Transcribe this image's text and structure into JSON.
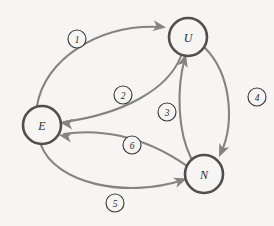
{
  "diagram": {
    "type": "directed-graph",
    "background_color": "#f7f5f3",
    "node_stroke_color": "#4f4f4f",
    "edge_color": "#838383",
    "badge_stroke_color": "#3d3d3d",
    "nodes": [
      {
        "id": "E",
        "label": "E",
        "cx": 42,
        "cy": 125,
        "r": 19
      },
      {
        "id": "U",
        "label": "U",
        "cx": 188,
        "cy": 37,
        "r": 19
      },
      {
        "id": "N",
        "label": "N",
        "cx": 204,
        "cy": 174,
        "r": 19
      }
    ],
    "edges": [
      {
        "id": "edge-1",
        "label": "1",
        "from": "E",
        "to": "U",
        "path": "M 37 106 C 44 60 98 24 160 27",
        "arrow": {
          "x": 166,
          "y": 27.5,
          "angle": 8
        },
        "badge": {
          "cx": 77,
          "cy": 39,
          "r": 9
        }
      },
      {
        "id": "edge-2",
        "label": "2",
        "from": "U",
        "to": "E",
        "path": "M 181 56 C 168 90 122 114 64 122",
        "arrow": {
          "x": 60,
          "y": 122.5,
          "angle": 187
        },
        "badge": {
          "cx": 123,
          "cy": 95,
          "r": 9
        }
      },
      {
        "id": "edge-3",
        "label": "3",
        "from": "N",
        "to": "U",
        "path": "M 191 158 C 178 132 176 90 185 58",
        "arrow": {
          "x": 186,
          "y": 54,
          "angle": -74
        },
        "badge": {
          "cx": 167,
          "cy": 112,
          "r": 9
        }
      },
      {
        "id": "edge-4",
        "label": "4",
        "from": "U",
        "to": "N",
        "path": "M 205 48 C 231 74 235 122 221 153",
        "arrow": {
          "x": 219,
          "y": 157,
          "angle": 114
        },
        "badge": {
          "cx": 257,
          "cy": 97,
          "r": 9
        }
      },
      {
        "id": "edge-5",
        "label": "5",
        "from": "E",
        "to": "N",
        "path": "M 41 145 C 55 183 125 199 183 180",
        "arrow": {
          "x": 187,
          "y": 178.5,
          "angle": -19
        },
        "badge": {
          "cx": 115,
          "cy": 203,
          "r": 9
        }
      },
      {
        "id": "edge-6",
        "label": "6",
        "from": "N",
        "to": "E",
        "path": "M 187 166 C 140 133 95 129 64 134",
        "arrow": {
          "x": 59,
          "y": 135,
          "angle": 190
        },
        "badge": {
          "cx": 132,
          "cy": 145,
          "r": 9
        }
      }
    ]
  }
}
